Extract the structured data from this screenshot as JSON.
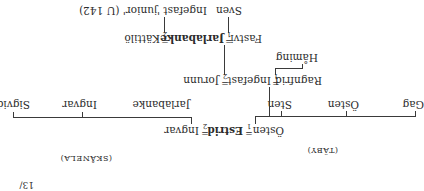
{
  "page_fragment": "13/",
  "regions": {
    "taby": "(TÄBY)",
    "skanela": "(SKÅNELA)"
  },
  "generation1": {
    "left_spouse": "Östen",
    "marriage1_num": "1",
    "center": "Estrid",
    "marriage2_num": "2",
    "right_spouse": "Ingvar"
  },
  "children_taby": [
    "Gag",
    "Östen",
    "Sten"
  ],
  "children_skanela": [
    "Jarlabanke",
    "Ingvar",
    "Sigvid"
  ],
  "generation2": {
    "left_spouse": "Ragnfrid",
    "marriage1_num": "1",
    "center": "Ingefast",
    "marriage2_num": "2",
    "right_spouse": "Jorunn",
    "ragnfrid_child": "Håming"
  },
  "generation3": {
    "left_spouse": "Fastvi",
    "marriage1_num": "1",
    "center": "Jarlabanke",
    "marriage2_num": "2",
    "right_spouse": "Kättilö"
  },
  "generation4": {
    "child1": "Sven",
    "child2": "Ingefast 'junior' (U 142)"
  },
  "equals_sign": "="
}
